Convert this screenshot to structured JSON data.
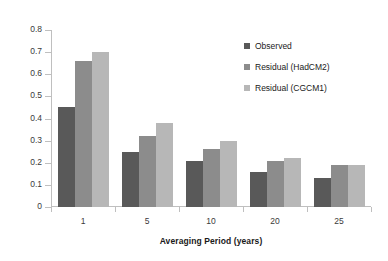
{
  "chart_data": {
    "type": "bar",
    "title": "",
    "xlabel": "Averaging Period (years)",
    "ylabel": "Standard Deviation",
    "categories": [
      "1",
      "5",
      "10",
      "20",
      "25"
    ],
    "series": [
      {
        "name": "Observed",
        "color": "#595959",
        "values": [
          0.45,
          0.25,
          0.21,
          0.16,
          0.13
        ]
      },
      {
        "name": "Residual (HadCM2)",
        "color": "#8c8c8c",
        "values": [
          0.66,
          0.32,
          0.26,
          0.21,
          0.19
        ]
      },
      {
        "name": "Residual (CGCM1)",
        "color": "#b7b7b7",
        "values": [
          0.7,
          0.38,
          0.3,
          0.22,
          0.19
        ]
      }
    ],
    "ylim": [
      0,
      0.8
    ],
    "ytick_labels": [
      "0.8",
      "0.7",
      "0.6",
      "0.5",
      "0.4",
      "0.3",
      "0.2",
      "0.1",
      "0"
    ],
    "ytick_values": [
      0.8,
      0.7,
      0.6,
      0.5,
      0.4,
      0.3,
      0.2,
      0.1,
      0
    ],
    "grid": false,
    "legend_position": "top-right"
  }
}
